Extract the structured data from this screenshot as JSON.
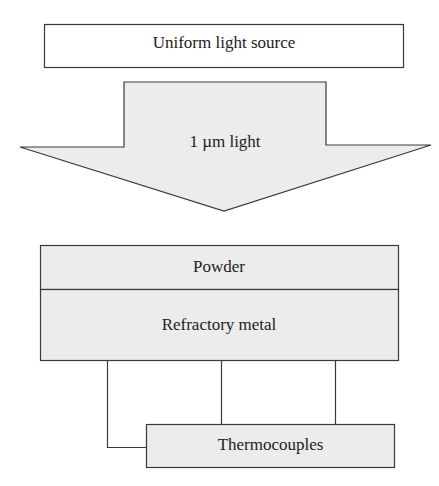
{
  "diagram": {
    "light_source": {
      "label": "Uniform light source"
    },
    "arrow": {
      "label": "1 µm light"
    },
    "sample": {
      "powder_label": "Powder",
      "metal_label": "Refractory metal"
    },
    "thermocouples": {
      "label": "Thermocouples",
      "wire_count": 3
    }
  },
  "colors": {
    "stroke": "#3a3a3a",
    "fill_gray": "#ececec",
    "background": "#ffffff"
  }
}
